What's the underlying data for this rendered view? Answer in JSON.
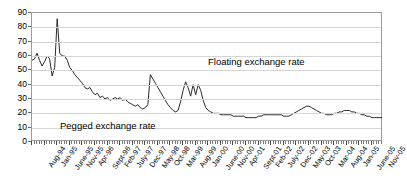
{
  "chart_data": {
    "type": "line",
    "title": "",
    "xlabel": "",
    "ylabel": "",
    "ylim": [
      0,
      90
    ],
    "ytick_step": 10,
    "yticks": [
      0,
      10,
      20,
      30,
      40,
      50,
      60,
      70,
      80,
      90
    ],
    "grid": true,
    "legend": "none",
    "line_color": "#2a2a2a",
    "annotations": [
      {
        "text": "Floating exchange rate",
        "x_region": "Dec-97 to Apr-06",
        "y_value": 55
      },
      {
        "text": "Pegged exchange rate",
        "x_region": "Aug-94 to Dec-97",
        "y_value": 12
      }
    ],
    "xtick_labels": [
      "Aug-94",
      "Jan-95",
      "June-95",
      "Nov-95",
      "Apr-96",
      "Sept-96",
      "Feb-97",
      "July-97",
      "Dec-97",
      "May-98",
      "Oct-98",
      "Mar-99",
      "Aug-99",
      "Jan-00",
      "June-00",
      "Nov-00",
      "Apr-01",
      "Sept-01",
      "Feb-02",
      "July-02",
      "Dec-02",
      "May-03",
      "Oct-03",
      "Mar-04",
      "Aug-04",
      "Jan-05",
      "June-05",
      "Nov-05",
      "Apr-06"
    ],
    "xtick_label_interval_months": 5,
    "x_start": "Aug-94",
    "x_end": "Apr-06",
    "series": [
      {
        "name": "Exchange rate",
        "values": [
          57,
          58,
          62,
          57,
          53,
          56,
          60,
          58,
          46,
          52,
          86,
          62,
          60,
          60,
          57,
          52,
          50,
          47,
          45,
          43,
          41,
          38,
          37,
          38,
          35,
          33,
          34,
          31,
          32,
          30,
          31,
          29,
          30,
          31,
          30,
          31,
          29,
          30,
          28,
          27,
          26,
          25,
          26,
          24,
          23,
          24,
          26,
          47,
          44,
          41,
          38,
          35,
          32,
          29,
          26,
          24,
          22,
          21,
          22,
          28,
          36,
          42,
          38,
          32,
          40,
          33,
          40,
          36,
          29,
          24,
          22,
          21,
          20,
          20,
          20,
          19,
          19,
          19,
          19,
          19,
          18,
          18,
          18,
          18,
          18,
          17,
          17,
          17,
          17,
          17,
          18,
          18,
          19,
          19,
          19,
          19,
          19,
          19,
          19,
          19,
          18,
          18,
          18,
          19,
          20,
          21,
          22,
          23,
          24,
          25,
          25,
          24,
          23,
          22,
          21,
          20,
          20,
          19,
          19,
          19,
          20,
          20,
          21,
          21,
          22,
          22,
          22,
          21,
          21,
          20,
          20,
          19,
          19,
          18,
          18,
          17,
          17,
          17,
          17,
          17
        ]
      }
    ]
  }
}
